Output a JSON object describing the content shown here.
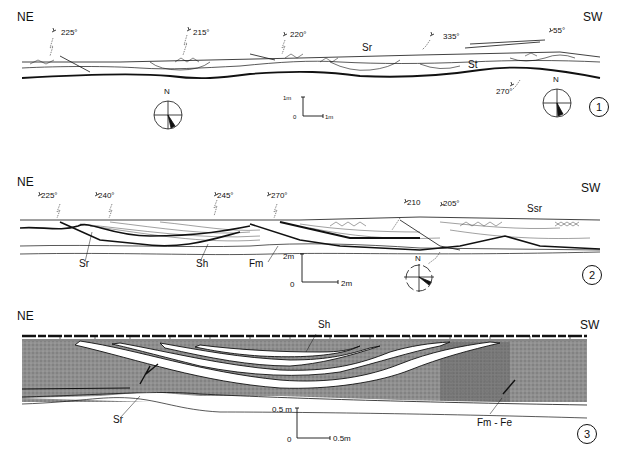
{
  "figure": {
    "panels": [
      {
        "number": "1",
        "left_label": "NE",
        "right_label": "SW",
        "azimuths": [
          "225°",
          "215°",
          "220°",
          "335°",
          "55°",
          "270°"
        ],
        "facies": [
          "Sr",
          "St"
        ],
        "scale": {
          "vertical": "1m",
          "horizontal": "1m",
          "origin": "0"
        },
        "compass": "N"
      },
      {
        "number": "2",
        "left_label": "NE",
        "right_label": "SW",
        "azimuths": [
          "225°",
          "240°",
          "245°",
          "270°",
          "210",
          "205°"
        ],
        "facies": [
          "Sr",
          "Sh",
          "Fm",
          "Ssr"
        ],
        "scale": {
          "vertical": "2m",
          "horizontal": "2m",
          "origin": "0"
        },
        "compass": "N"
      },
      {
        "number": "3",
        "left_label": "NE",
        "right_label": "SW",
        "facies": [
          "Sh",
          "Sr",
          "Fm - Fe"
        ],
        "scale": {
          "vertical": "0.5 m",
          "horizontal": "0.5m",
          "origin": "0"
        }
      }
    ]
  }
}
